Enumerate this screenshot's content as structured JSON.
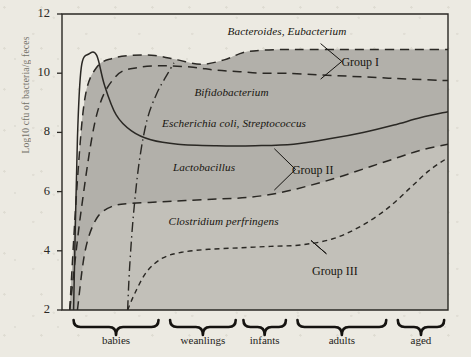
{
  "figure": {
    "background_color": "#eceae2",
    "band_fill_dark": "#b2b0aa",
    "band_fill_light": "#c2c0b9",
    "axis_color": "#2a2824",
    "ylabel": "Log10 cfu of bacteria/g feces"
  },
  "chart_data": {
    "type": "area",
    "title": "",
    "subtitle": "",
    "xlabel": "",
    "ylabel": "Log10 cfu of bacteria/g feces",
    "ylim": [
      2,
      12
    ],
    "yticks": [
      2,
      4,
      6,
      8,
      10,
      12
    ],
    "xlim": [
      0,
      100
    ],
    "grid": false,
    "legend_position": "inline-annotations",
    "categories": [
      "babies",
      "weanlings",
      "infants",
      "adults",
      "aged"
    ],
    "category_spans": [
      {
        "label": "babies",
        "start": 3,
        "end": 25
      },
      {
        "label": "weanlings",
        "start": 28,
        "end": 45
      },
      {
        "label": "infants",
        "start": 47,
        "end": 58
      },
      {
        "label": "adults",
        "start": 61,
        "end": 84
      },
      {
        "label": "aged",
        "start": 87,
        "end": 99
      }
    ],
    "series": [
      {
        "name": "Bacteroides, Eubacterium",
        "group": "Group I",
        "style": "dashed-long",
        "x": [
          2,
          4,
          6,
          9,
          13,
          18,
          24,
          30,
          36,
          42,
          47,
          52,
          58,
          64,
          72,
          80,
          88,
          94,
          100
        ],
        "values": [
          2.0,
          6.4,
          9.2,
          10.2,
          10.5,
          10.6,
          10.6,
          10.45,
          10.3,
          10.45,
          10.7,
          10.78,
          10.8,
          10.8,
          10.8,
          10.8,
          10.8,
          10.8,
          10.8
        ]
      },
      {
        "name": "Bifidobacterium",
        "group": "Group I",
        "style": "dashed-long",
        "x": [
          2,
          5,
          9,
          14,
          20,
          27,
          34,
          40,
          46,
          52,
          58,
          66,
          74,
          82,
          90,
          100
        ],
        "values": [
          2.0,
          5.4,
          8.6,
          9.9,
          10.2,
          10.25,
          10.2,
          10.1,
          10.05,
          10.0,
          10.0,
          9.95,
          9.9,
          9.85,
          9.8,
          9.75
        ]
      },
      {
        "name": "Escherichia coli, Streptococcus",
        "group": "",
        "style": "solid",
        "x": [
          3,
          4,
          5,
          7,
          9,
          11,
          14,
          18,
          23,
          30,
          40,
          50,
          60,
          70,
          78,
          86,
          93,
          100
        ],
        "values": [
          2.0,
          7.8,
          10.2,
          10.65,
          10.6,
          9.6,
          8.6,
          8.05,
          7.75,
          7.6,
          7.55,
          7.55,
          7.6,
          7.8,
          8.0,
          8.25,
          8.5,
          8.7
        ]
      },
      {
        "name": "Lactobacillus",
        "group": "Group II",
        "style": "dashed-long",
        "x": [
          4,
          6,
          9,
          13,
          18,
          25,
          32,
          40,
          48,
          56,
          64,
          72,
          80,
          87,
          93,
          100
        ],
        "values": [
          2.0,
          4.0,
          5.1,
          5.5,
          5.6,
          5.65,
          5.7,
          5.75,
          5.8,
          5.95,
          6.2,
          6.5,
          6.85,
          7.15,
          7.4,
          7.6
        ]
      },
      {
        "name": "Clostridium perfringens",
        "group": "Group III",
        "style": "dashed-short",
        "x": [
          17,
          19,
          22,
          26,
          31,
          38,
          46,
          54,
          62,
          70,
          77,
          84,
          90,
          95,
          100
        ],
        "values": [
          2.0,
          2.6,
          3.3,
          3.75,
          3.95,
          4.05,
          4.1,
          4.15,
          4.2,
          4.4,
          4.8,
          5.4,
          6.1,
          6.7,
          7.15
        ]
      },
      {
        "name": "divider",
        "group": "",
        "style": "dash-dot",
        "x": [
          17,
          17.5,
          18.5,
          20,
          22,
          24.5,
          27,
          29
        ],
        "values": [
          2.0,
          3.4,
          5.2,
          7.0,
          8.4,
          9.3,
          9.9,
          10.35
        ]
      }
    ],
    "annotations": [
      {
        "text": "Bacteroides, Eubacterium",
        "style": "italic",
        "x": 60,
        "y": 11.35
      },
      {
        "text": "Group I",
        "style": "roman",
        "x": 78,
        "y": 10.35
      },
      {
        "text": "Bifidobacterium",
        "style": "italic",
        "x": 45,
        "y": 9.3
      },
      {
        "text": "Escherichia coli, Streptococcus",
        "style": "italic",
        "x": 48,
        "y": 8.25
      },
      {
        "text": "Lactobacillus",
        "style": "italic",
        "x": 38,
        "y": 6.75
      },
      {
        "text": "Group II",
        "style": "roman",
        "x": 66,
        "y": 6.7
      },
      {
        "text": "Clostridium perfringens",
        "style": "italic",
        "x": 44,
        "y": 4.95
      },
      {
        "text": "Group III",
        "style": "roman",
        "x": 72,
        "y": 3.3
      }
    ]
  }
}
